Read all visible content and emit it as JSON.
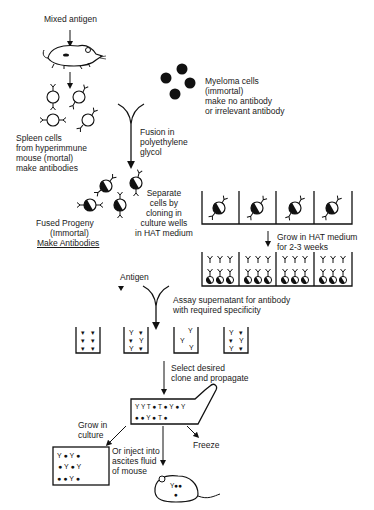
{
  "diagram": {
    "topic": "Monoclonal antibody production (hybridoma technique)",
    "labels": {
      "mixed_antigen": "Mixed antigen",
      "myeloma_cells": "Myeloma cells\n(immortal)\nmake no antibody\nor irrelevant antibody",
      "spleen_cells": "Spleen cells\nfrom hyperimmune\nmouse (mortal)\nmake antibodies",
      "fusion": "Fusion in\npolyethylene\nglycol",
      "separate_cells": "Separate\ncells by\ncloning in\nculture wells\nin HAT medium",
      "fused_progeny_line1": "Fused Progeny",
      "fused_progeny_line2": "(Immortal)",
      "fused_progeny_line3": "Make Antibodies",
      "grow_hat": "Grow in HAT medium\nfor 2-3 weeks",
      "antigen": "Antigen",
      "assay": "Assay supernatant for antibody\nwith required specificity",
      "select_clone": "Select desired\nclone and propagate",
      "grow_culture": "Grow in\nculture",
      "freeze": "Freeze",
      "inject_ascites": "Or inject into\nascites fluid\nof mouse"
    },
    "counts": {
      "cloning_wells": 4,
      "hat_wells": 4,
      "cells_per_hat_well": 3,
      "assay_wells": 4,
      "myeloma_cells": 4
    },
    "colors": {
      "ink": "#111111",
      "background": "#ffffff"
    }
  }
}
